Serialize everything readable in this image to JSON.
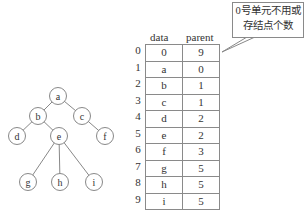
{
  "tree": {
    "nodes": [
      {
        "id": "a",
        "x": 58,
        "y": 96
      },
      {
        "id": "b",
        "x": 38,
        "y": 116
      },
      {
        "id": "c",
        "x": 82,
        "y": 116
      },
      {
        "id": "d",
        "x": 17,
        "y": 136
      },
      {
        "id": "e",
        "x": 59,
        "y": 136
      },
      {
        "id": "f",
        "x": 105,
        "y": 136
      },
      {
        "id": "g",
        "x": 28,
        "y": 182
      },
      {
        "id": "h",
        "x": 60,
        "y": 182
      },
      {
        "id": "i",
        "x": 94,
        "y": 182
      }
    ],
    "edges": [
      [
        "a",
        "b"
      ],
      [
        "a",
        "c"
      ],
      [
        "b",
        "d"
      ],
      [
        "b",
        "e"
      ],
      [
        "c",
        "f"
      ],
      [
        "e",
        "g"
      ],
      [
        "e",
        "h"
      ],
      [
        "e",
        "i"
      ]
    ]
  },
  "table": {
    "headers": {
      "data": "data",
      "parent": "parent"
    },
    "rows": [
      {
        "index": "0",
        "data": "0",
        "parent": "9"
      },
      {
        "index": "1",
        "data": "a",
        "parent": "0"
      },
      {
        "index": "2",
        "data": "b",
        "parent": "1"
      },
      {
        "index": "3",
        "data": "c",
        "parent": "1"
      },
      {
        "index": "4",
        "data": "d",
        "parent": "2"
      },
      {
        "index": "5",
        "data": "e",
        "parent": "2"
      },
      {
        "index": "6",
        "data": "f",
        "parent": "3"
      },
      {
        "index": "7",
        "data": "g",
        "parent": "5"
      },
      {
        "index": "8",
        "data": "h",
        "parent": "5"
      },
      {
        "index": "9",
        "data": "i",
        "parent": "5"
      }
    ]
  },
  "callout": {
    "line1": "0号单元不用或",
    "line2": "存结点个数"
  }
}
